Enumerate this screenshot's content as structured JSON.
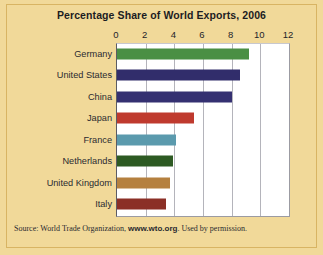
{
  "figure": {
    "background_color": "#f1d999",
    "frame_color": "#d8b463",
    "plot_background": "#ffffff"
  },
  "title": "Percentage Share of World Exports, 2006",
  "source": {
    "prefix": "Source: World Trade Organization, ",
    "url": "www.wto.org",
    "suffix": ". Used by permission."
  },
  "chart_data": {
    "type": "bar",
    "orientation": "horizontal",
    "title": "Percentage Share of World Exports, 2006",
    "xlabel": "",
    "ylabel": "",
    "xlim": [
      0,
      12
    ],
    "ylim": null,
    "grid": true,
    "legend": null,
    "xticks": [
      0,
      2,
      4,
      6,
      8,
      10,
      12
    ],
    "xtick_labels": [
      "0",
      "2",
      "4",
      "6",
      "8",
      "10",
      "12"
    ],
    "categories": [
      "Germany",
      "United States",
      "China",
      "Japan",
      "France",
      "Netherlands",
      "United Kingdom",
      "Italy"
    ],
    "values": [
      9.2,
      8.6,
      8.0,
      5.4,
      4.1,
      3.9,
      3.7,
      3.4
    ],
    "bar_colors": [
      "#4a8f44",
      "#312d6b",
      "#343071",
      "#bf3a2e",
      "#5b9aad",
      "#2d5a23",
      "#b5803f",
      "#8b2f26"
    ],
    "units": "percent"
  }
}
